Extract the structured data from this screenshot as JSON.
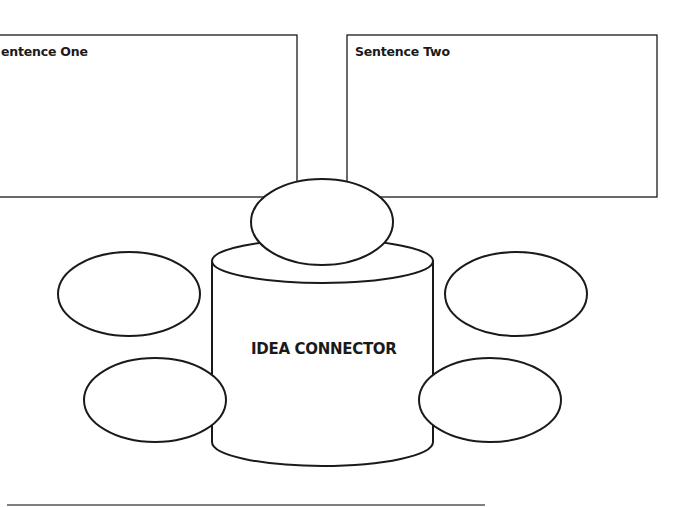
{
  "diagram": {
    "title": "Idea Connector",
    "boxes": [
      {
        "id": "sentence-one",
        "label": "Sentence One",
        "visible_label": "entence One",
        "content": ""
      },
      {
        "id": "sentence-two",
        "label": "Sentence Two",
        "visible_label": "Sentence Two",
        "content": ""
      }
    ],
    "center": {
      "label": "IDEA CONNECTOR"
    },
    "bubbles": [
      {
        "id": "top",
        "content": ""
      },
      {
        "id": "left-top",
        "content": ""
      },
      {
        "id": "left-bottom",
        "content": ""
      },
      {
        "id": "right-top",
        "content": ""
      },
      {
        "id": "right-bottom",
        "content": ""
      }
    ],
    "colors": {
      "stroke": "#1a1a1a",
      "background": "#ffffff",
      "rule": "#555555"
    }
  }
}
